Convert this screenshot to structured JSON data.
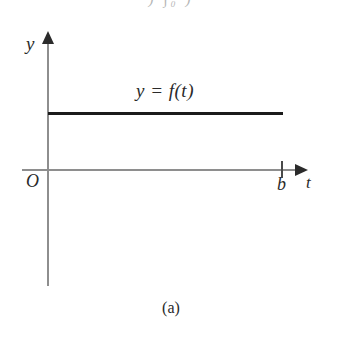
{
  "figure": {
    "caption": "(a)",
    "top_fragment": ") ∫₀ )",
    "background_color": "#ffffff",
    "ink_color": "#1b1b1b",
    "axis_color": "#8e8e8e"
  },
  "axes": {
    "y_axis_label": "y",
    "t_axis_label": "t",
    "origin_label": "O",
    "tick_labels": [
      "b"
    ]
  },
  "curve": {
    "label": "y = f(t)",
    "description": "constant horizontal line"
  },
  "chart_data": {
    "type": "line",
    "title": "",
    "subtitle": "",
    "xlabel": "t",
    "ylabel": "y",
    "grid": false,
    "legend": "none",
    "annotations": [
      "y = f(t)",
      "O",
      "b",
      "(a)"
    ],
    "xlim": [
      0,
      1.08
    ],
    "ylim": [
      -0.52,
      0.62
    ],
    "xticks": [
      0,
      1
    ],
    "xticklabels": [
      "O",
      "b"
    ],
    "yticks": [],
    "yticklabels": [],
    "series": [
      {
        "name": "y = f(t)",
        "x": [
          0,
          1
        ],
        "values": [
          0.243,
          0.243
        ]
      }
    ]
  }
}
